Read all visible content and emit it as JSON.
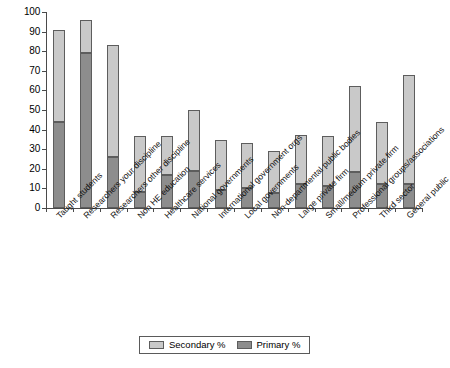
{
  "chart_data": {
    "type": "bar",
    "stacked": true,
    "title": "",
    "subtitle": "",
    "xlabel": "",
    "ylabel": "",
    "ylim": [
      0,
      100
    ],
    "ytick_labels": [
      "0",
      "10",
      "20",
      "30",
      "40",
      "50",
      "60",
      "70",
      "80",
      "90",
      "100"
    ],
    "ytick_values": [
      0,
      10,
      20,
      30,
      40,
      50,
      60,
      70,
      80,
      90,
      100
    ],
    "grid": false,
    "legend_position": "bottom",
    "categories": [
      "Taught students",
      "Researchers your discipline",
      "Researchers other discipline",
      "Non HE education",
      "Healthcare services",
      "National governments",
      "International government orgs",
      "Local governments",
      "Non-departmental public bodies",
      "Large private firm",
      "Small/medium private firm",
      "Professional groups/associations",
      "Third sector",
      "General public"
    ],
    "series": [
      {
        "name": "Primary %",
        "color": "#8d8d8d",
        "values": [
          44,
          79,
          26,
          8,
          17,
          19,
          9,
          10,
          7.5,
          12,
          11,
          18.5,
          12,
          12.5
        ]
      },
      {
        "name": "Secondary %",
        "color": "#c9c9c9",
        "values": [
          47,
          17,
          57,
          29,
          20,
          31,
          25.5,
          23,
          21.5,
          25,
          26,
          44,
          32,
          55.5
        ]
      }
    ],
    "totals": [
      91,
      96,
      83,
      37,
      37,
      50,
      34.5,
      33,
      29,
      37,
      37,
      62.5,
      44,
      68
    ]
  },
  "legend": {
    "items": [
      {
        "label": "Secondary %",
        "color": "#c9c9c9"
      },
      {
        "label": "Primary %",
        "color": "#8d8d8d"
      }
    ]
  }
}
